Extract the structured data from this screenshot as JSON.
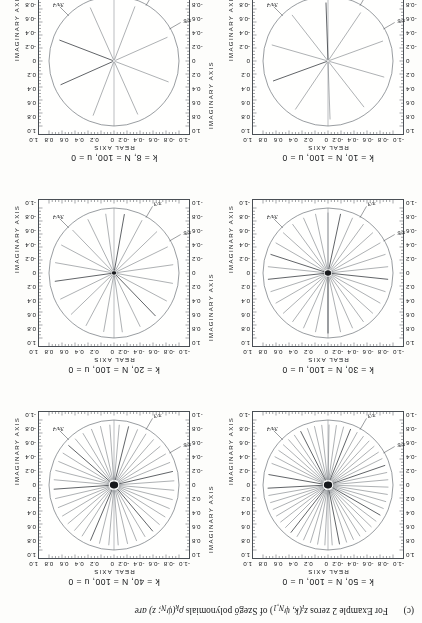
{
  "caption": {
    "tag": "(c)",
    "text_1": "For Example 2 zeros ",
    "text_z": "z",
    "text_sub": "i",
    "text_2": "(k, ψ",
    "text_sub2": "N,1",
    "text_3": ") of Szegő polynomials ",
    "text_rho": "ρ",
    "text_sub3": "k",
    "text_4": "(ψ",
    "text_sub4": "N",
    "text_5": "; z) are",
    "full": "(c)    For Example 2 zeros zi(k, ψN,1) of Szegő polynomials ρk(ψN; z) are"
  },
  "axes": {
    "x_label": "REAL AXIS",
    "y_label": "IMAGINARY AXIS",
    "x_ticks": [
      "-1.0",
      "-0.8",
      "-0.6",
      "-0.4",
      "-0.2",
      "0",
      "0.2",
      "0.4",
      "0.6",
      "0.8",
      "1.0"
    ],
    "y_ticks": [
      "1.0",
      "0.8",
      "0.6",
      "0.4",
      "0.2",
      "0",
      "-0.2",
      "-0.4",
      "-0.6",
      "-0.8",
      "-1.0"
    ],
    "xlim": [
      -1.0,
      1.0
    ],
    "ylim": [
      -1.0,
      1.0
    ]
  },
  "angle_annotations": [
    {
      "label": "π/6",
      "angle_deg": 210
    },
    {
      "label": "π/3",
      "angle_deg": 240
    },
    {
      "label": "3π/4",
      "angle_deg": 315
    }
  ],
  "panels": [
    {
      "id": "k50",
      "title": "k = 50, N = 100, u = 0",
      "k": 50,
      "N": 100,
      "u": 0,
      "n_zeros": 50
    },
    {
      "id": "k40",
      "title": "k = 40, N = 100, u = 0",
      "k": 40,
      "N": 100,
      "u": 0,
      "n_zeros": 40
    },
    {
      "id": "k30",
      "title": "k = 30, N = 100, u = 0",
      "k": 30,
      "N": 100,
      "u": 0,
      "n_zeros": 30
    },
    {
      "id": "k20",
      "title": "k = 20, N = 100, u = 0",
      "k": 20,
      "N": 100,
      "u": 0,
      "n_zeros": 20
    },
    {
      "id": "k10",
      "title": "k = 10, N = 100, u = 0",
      "k": 10,
      "N": 100,
      "u": 0,
      "n_zeros": 10
    },
    {
      "id": "k8",
      "title": "k = 8, N = 100, u = 0",
      "k": 8,
      "N": 100,
      "u": 0,
      "n_zeros": 8
    }
  ],
  "chart_data": {
    "type": "scatter",
    "xlabel": "REAL AXIS",
    "ylabel": "IMAGINARY AXIS",
    "xlim": [
      -1.0,
      1.0
    ],
    "ylim": [
      -1.0,
      1.0
    ],
    "grid": false,
    "legend": "none",
    "note": "Each panel plots the k zeros z_i(k, psi_N,1) as radial traces inside the unit circle; traces emanate from the origin toward the unit circle at the zero's argument.",
    "panels": [
      {
        "name": "k = 50, N = 100, u = 0",
        "radius_inner": 0.08,
        "radius_outer": 0.93,
        "angles_deg": [
          3,
          10,
          17,
          24,
          31,
          38,
          45,
          52,
          59,
          66,
          73,
          80,
          87,
          94,
          101,
          108,
          115,
          122,
          129,
          136,
          143,
          150,
          157,
          164,
          171,
          178,
          185,
          192,
          199,
          206,
          213,
          220,
          227,
          234,
          241,
          248,
          255,
          262,
          269,
          276,
          283,
          290,
          297,
          304,
          311,
          318,
          325,
          332,
          339,
          350
        ]
      },
      {
        "name": "k = 40, N = 100, u = 0",
        "radius_inner": 0.08,
        "radius_outer": 0.93,
        "angles_deg": [
          4,
          13,
          22,
          31,
          40,
          49,
          58,
          67,
          76,
          85,
          94,
          103,
          112,
          121,
          130,
          139,
          148,
          157,
          166,
          175,
          184,
          193,
          202,
          211,
          220,
          229,
          238,
          247,
          256,
          265,
          274,
          283,
          292,
          301,
          310,
          319,
          328,
          337,
          346,
          355
        ]
      },
      {
        "name": "k = 30, N = 100, u = 0",
        "radius_inner": 0.06,
        "radius_outer": 0.93,
        "angles_deg": [
          6,
          18,
          30,
          42,
          54,
          66,
          78,
          90,
          102,
          114,
          126,
          138,
          150,
          162,
          174,
          186,
          198,
          210,
          222,
          234,
          246,
          258,
          270,
          282,
          294,
          306,
          318,
          330,
          342,
          354
        ]
      },
      {
        "name": "k = 20, N = 100, u = 0",
        "radius_inner": 0.04,
        "radius_outer": 0.92,
        "angles_deg": [
          8,
          26,
          44,
          62,
          80,
          98,
          116,
          134,
          152,
          170,
          188,
          206,
          224,
          242,
          260,
          278,
          296,
          314,
          332,
          350
        ]
      },
      {
        "name": "k = 10, N = 100, u = 0",
        "radius_inner": 0.02,
        "radius_outer": 0.9,
        "angles_deg": [
          20,
          56,
          92,
          128,
          164,
          200,
          236,
          272,
          308,
          344
        ]
      },
      {
        "name": "k = 8, N = 100, u = 0",
        "radius_inner": 0.02,
        "radius_outer": 0.9,
        "angles_deg": [
          24,
          69,
          114,
          159,
          204,
          249,
          294,
          339
        ]
      }
    ]
  }
}
